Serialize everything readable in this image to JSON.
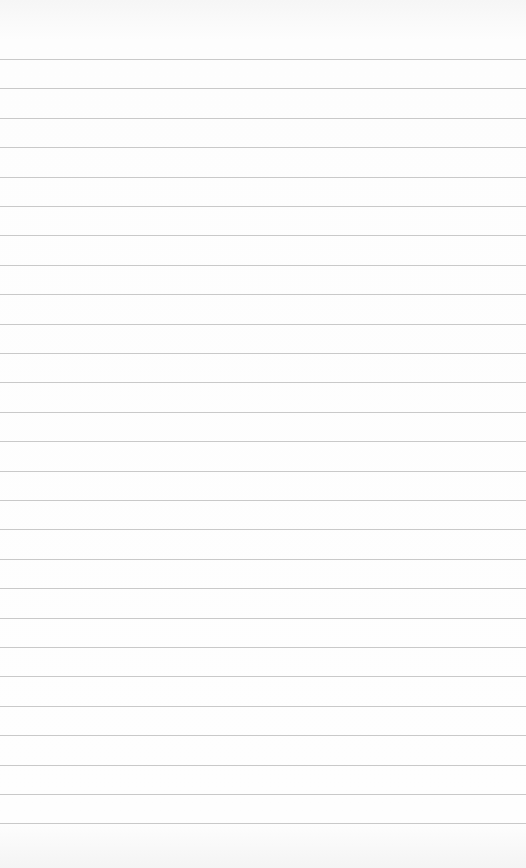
{
  "paper": {
    "background_color": "#fcfcfc",
    "line_color": "#c9c9c9",
    "first_line_y": 59,
    "line_spacing": 29.4,
    "line_count": 27
  }
}
